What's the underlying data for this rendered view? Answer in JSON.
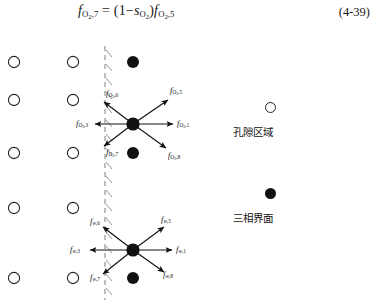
{
  "equation": {
    "number": "(4-39)",
    "lhs_symbol": "f",
    "lhs_sub_species": "O",
    "lhs_sub_species_num": "2",
    "lhs_sub_index": "7",
    "factor_open": "= (1−",
    "sat_symbol": "s",
    "sat_sub_species": "O",
    "sat_sub_species_num": "2",
    "factor_close": ")",
    "rhs_symbol": "f",
    "rhs_sub_species": "O",
    "rhs_sub_species_num": "2",
    "rhs_sub_index": "5",
    "plain_text": "f(O2,7) = (1 - s(O2)) f(O2,5)"
  },
  "diagram": {
    "interface_line": "vertical-dashed-interface",
    "open_circle_columns_x": [
      14,
      73
    ],
    "filled_circle_column_x": 133,
    "row_y": [
      34,
      72,
      125,
      180,
      250
    ],
    "upper_node": {
      "species": "O2",
      "center_x": 133,
      "center_y": 96,
      "fluxes": [
        {
          "name": "f_O2_6",
          "symbol": "f",
          "species": "O",
          "species_num": "2",
          "index": "6",
          "direction": "up-left"
        },
        {
          "name": "f_O2_5",
          "symbol": "f",
          "species": "O",
          "species_num": "2",
          "index": "5",
          "direction": "up-right"
        },
        {
          "name": "f_O2_3",
          "symbol": "f",
          "species": "O",
          "species_num": "2",
          "index": "3",
          "direction": "left"
        },
        {
          "name": "f_O2_1",
          "symbol": "f",
          "species": "O",
          "species_num": "2",
          "index": "1",
          "direction": "right"
        },
        {
          "name": "f_O2_7",
          "symbol": "f",
          "species": "O",
          "species_num": "2",
          "index": "7",
          "direction": "down-left"
        },
        {
          "name": "f_O2_8",
          "symbol": "f",
          "species": "O",
          "species_num": "2",
          "index": "8",
          "direction": "down-right"
        }
      ]
    },
    "lower_node": {
      "species": "w",
      "center_x": 133,
      "center_y": 222,
      "fluxes": [
        {
          "name": "f_w_6",
          "symbol": "f",
          "species": "w",
          "species_num": "",
          "index": "6",
          "direction": "up-left"
        },
        {
          "name": "f_w_5",
          "symbol": "f",
          "species": "w",
          "species_num": "",
          "index": "5",
          "direction": "up-right"
        },
        {
          "name": "f_w_3",
          "symbol": "f",
          "species": "w",
          "species_num": "",
          "index": "3",
          "direction": "left"
        },
        {
          "name": "f_w_1",
          "symbol": "f",
          "species": "w",
          "species_num": "",
          "index": "1",
          "direction": "right"
        },
        {
          "name": "f_w_7",
          "symbol": "f",
          "species": "w",
          "species_num": "",
          "index": "7",
          "direction": "down-left"
        },
        {
          "name": "f_w_8",
          "symbol": "f",
          "species": "w",
          "species_num": "",
          "index": "8",
          "direction": "down-right"
        }
      ]
    }
  },
  "legend": {
    "items": [
      {
        "marker": "open-circle",
        "label": "孔隙区域"
      },
      {
        "marker": "filled-circle",
        "label": "三相界面"
      }
    ]
  },
  "colors": {
    "ink": "#111111",
    "dashed_line": "#8a8a8a",
    "background": "#ffffff"
  }
}
